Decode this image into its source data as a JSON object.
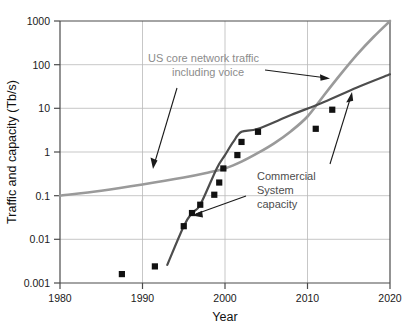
{
  "chart_data": {
    "type": "line",
    "title": "",
    "xlabel": "Year",
    "ylabel": "Traffic and capacity (Tb/s)",
    "xlim": [
      1980,
      2020
    ],
    "ylim": [
      0.001,
      1000
    ],
    "yscale": "log",
    "xticks": [
      "1980",
      "1990",
      "2000",
      "2010",
      "2020"
    ],
    "xtick_values": [
      1980,
      1990,
      2000,
      2010,
      2020
    ],
    "yticks": [
      "0.001",
      "0.01",
      "0.1",
      "1",
      "10",
      "100",
      "1000"
    ],
    "ytick_values": [
      0.001,
      0.01,
      0.1,
      1,
      10,
      100,
      1000
    ],
    "grid": true,
    "legend_position": "inline-annotations",
    "series": [
      {
        "name": "US core network traffic including voice",
        "type": "line",
        "color": "#9a9a9a",
        "x": [
          1980,
          1985,
          1990,
          1995,
          1998,
          2000,
          2002,
          2004,
          2006,
          2008,
          2010,
          2012,
          2014,
          2016,
          2018,
          2020
        ],
        "y": [
          0.1,
          0.13,
          0.18,
          0.26,
          0.34,
          0.42,
          0.6,
          0.95,
          1.6,
          3.0,
          6.5,
          20,
          60,
          170,
          430,
          1000
        ]
      },
      {
        "name": "Commercial System capacity",
        "type": "line",
        "color": "#4d4d4d",
        "x": [
          1993,
          1995,
          1996,
          1997,
          1999,
          2000,
          2001,
          2002,
          2004,
          2008,
          2012,
          2016,
          2020
        ],
        "y": [
          0.0026,
          0.02,
          0.04,
          0.062,
          0.42,
          0.85,
          1.7,
          2.9,
          3.4,
          7.0,
          14,
          30,
          60
        ]
      },
      {
        "name": "Commercial System capacity data points",
        "type": "scatter",
        "color": "#111111",
        "marker": "square",
        "x": [
          1987.5,
          1991.5,
          1995,
          1996,
          1997,
          1998.7,
          1999.3,
          1999.8,
          2001.5,
          2002,
          2004,
          2011,
          2013
        ],
        "y": [
          0.0016,
          0.0024,
          0.02,
          0.04,
          0.062,
          0.105,
          0.2,
          0.42,
          0.85,
          1.7,
          2.9,
          3.4,
          9.3
        ]
      }
    ],
    "annotations": [
      {
        "name": "us-core-network-traffic-label",
        "lines": [
          "US core network traffic",
          "including voice"
        ],
        "color": "#9a9a9a"
      },
      {
        "name": "commercial-system-capacity-label",
        "lines": [
          "Commercial",
          "System",
          "capacity"
        ],
        "color": "#4d4d4d"
      }
    ]
  }
}
